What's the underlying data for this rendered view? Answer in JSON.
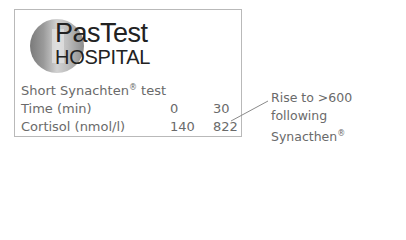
{
  "logo": {
    "line1": "PasTest",
    "line2": "HOSPITAL"
  },
  "test": {
    "title": "Short Synachten",
    "title_mark": "®",
    "rows": [
      {
        "label": "Time (min)",
        "values": [
          "0",
          "30"
        ]
      },
      {
        "label": "Cortisol (nmol/l)",
        "values": [
          "140",
          "822"
        ]
      }
    ]
  },
  "annotation": {
    "line1": "Rise to >600 following",
    "line2": "Synacthen",
    "mark": "®"
  },
  "colors": {
    "border": "#b9b9b9",
    "text": "#6a6a6a",
    "logo_text": "#222222"
  }
}
